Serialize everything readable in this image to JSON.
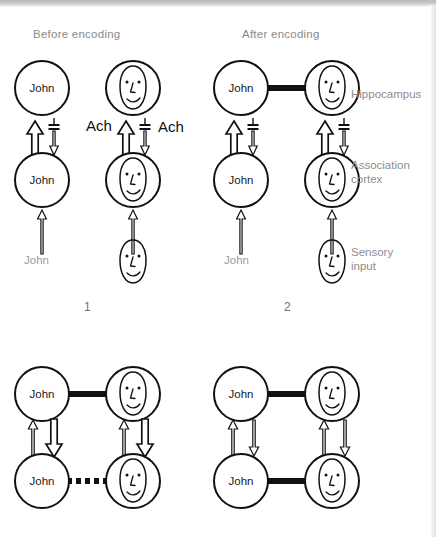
{
  "figure": {
    "headers": {
      "before": "Before encoding",
      "after": "After encoding"
    },
    "row_labels": {
      "hippocampus": "Hippocampus",
      "association_cortex_line1": "Association",
      "association_cortex_line2": "cortex",
      "sensory_input_line1": "Sensory",
      "sensory_input_line2": "input"
    },
    "neurotransmitter_label": "Ach",
    "node_label_name": "John",
    "stimulus_label_name": "John",
    "panel_numbers": [
      "1",
      "2"
    ],
    "colors": {
      "ink": "#111111",
      "label_gray": "#8a8a8a",
      "stimulus_gray": "#9b9b9b",
      "page_background": "#ffffff",
      "scan_edge_gray": "#c9c9c9"
    },
    "panels": [
      {
        "id": "panel-1",
        "number": "1",
        "header": "Before encoding",
        "hippocampus_left": "John",
        "hippocampus_right": "face",
        "association_left": "John",
        "association_right": "face",
        "sensory_left": "John",
        "sensory_right": "face",
        "hippocampal_link": "none",
        "cortical_link": "none",
        "ach_labels": [
          "Ach",
          "Ach"
        ],
        "upward_arrow": "thick-hollow",
        "downward_arrow": "thin-hollow-with-inhibition-bars"
      },
      {
        "id": "panel-2",
        "number": "2",
        "header": "After encoding",
        "hippocampus_left": "John",
        "hippocampus_right": "face",
        "association_left": "John",
        "association_right": "face",
        "sensory_left": "John",
        "sensory_right": "face",
        "hippocampal_link": "thick-solid",
        "cortical_link": "none",
        "ach_labels": [],
        "upward_arrow": "thick-hollow",
        "downward_arrow": "thin-hollow-with-inhibition-bars"
      },
      {
        "id": "panel-3",
        "number": "",
        "header": "",
        "hippocampus_left": "John",
        "hippocampus_right": "face",
        "association_left": "John",
        "association_right": "face",
        "hippocampal_link": "thick-solid",
        "cortical_link": "thick-dotted",
        "upward_arrow": "thin-hollow",
        "downward_arrow": "thick-hollow"
      },
      {
        "id": "panel-4",
        "number": "",
        "header": "",
        "hippocampus_left": "John",
        "hippocampus_right": "face",
        "association_left": "John",
        "association_right": "face",
        "hippocampal_link": "thick-solid",
        "cortical_link": "thick-solid",
        "upward_arrow": "thin-hollow",
        "downward_arrow": "thin-hollow"
      }
    ]
  }
}
